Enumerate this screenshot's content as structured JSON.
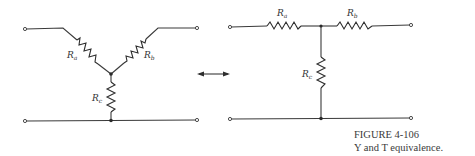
{
  "figure": {
    "number": "FIGURE 4-106",
    "caption": "Y and T equivalence."
  },
  "y_network": {
    "resistors": [
      {
        "name": "R",
        "sub": "a"
      },
      {
        "name": "R",
        "sub": "b"
      },
      {
        "name": "R",
        "sub": "c"
      }
    ]
  },
  "t_network": {
    "resistors": [
      {
        "name": "R",
        "sub": "a"
      },
      {
        "name": "R",
        "sub": "b"
      },
      {
        "name": "R",
        "sub": "c"
      }
    ]
  },
  "equivalence_arrow": "double-arrow-icon",
  "colors": {
    "ink": "#333333",
    "background": "#ffffff"
  }
}
